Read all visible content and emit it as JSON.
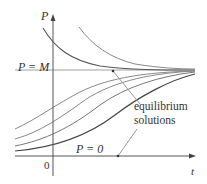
{
  "diagram": {
    "type": "logistic-solution-curves",
    "axes": {
      "vertical_label": "P",
      "horizontal_label": "t",
      "origin_label": "0"
    },
    "labels": {
      "upper_equilibrium": "P = M",
      "lower_equilibrium": "P = 0",
      "annotation_line1": "equilibrium",
      "annotation_line2": "solutions"
    },
    "colors": {
      "axis": "#555555",
      "curve_dark": "#444444",
      "curve_light": "#8a8a8a",
      "equilibrium_line": "#9a9a9a",
      "text": "#333333"
    }
  }
}
